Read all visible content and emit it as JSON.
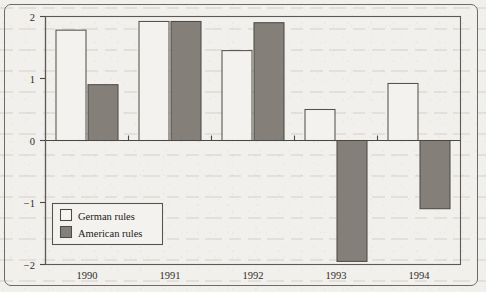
{
  "chart_data": {
    "type": "bar",
    "title": "",
    "subtitle": "",
    "xlabel": "",
    "ylabel": "",
    "categories": [
      "1990",
      "1991",
      "1992",
      "1993",
      "1994"
    ],
    "series": [
      {
        "name": "German rules",
        "values": [
          1.78,
          1.92,
          1.45,
          0.5,
          0.92
        ]
      },
      {
        "name": "American rules",
        "values": [
          0.9,
          1.92,
          1.9,
          -1.95,
          -1.1
        ]
      }
    ],
    "ylim": [
      -2,
      2
    ],
    "yticks": [
      2,
      1,
      0,
      -1,
      -2
    ],
    "yticklabels": [
      "2",
      "1",
      "0",
      "−1",
      "−2"
    ],
    "grid": false,
    "zero_line": true,
    "legend_position": "lower-left-inside",
    "annotations": []
  },
  "legend": {
    "entries": [
      {
        "label": "German rules",
        "swatch": "white",
        "color": "#f7f5f1"
      },
      {
        "label": "American rules",
        "swatch": "gray-fill",
        "color": "#848079"
      }
    ]
  },
  "colors": {
    "page_background": "#f2f0ec",
    "frame_stroke": "#6e6a64",
    "axis_stroke": "#4a4744",
    "german_fill": "#f4f2ee",
    "american_fill": "#848079",
    "text": "#2e2b27"
  }
}
